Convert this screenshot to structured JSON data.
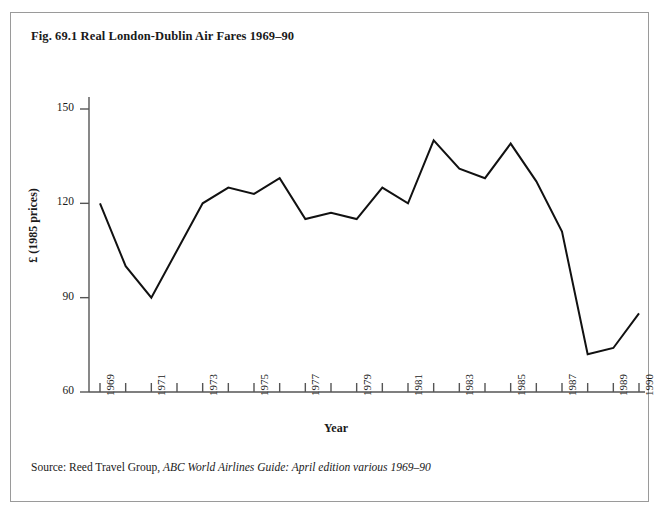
{
  "figure": {
    "title": "Fig. 69.1 Real London-Dublin Air Fares 1969–90",
    "source_prefix": "Source: Reed Travel Group, ",
    "source_italic": "ABC World Airlines Guide: April edition various 1969–90"
  },
  "chart_data": {
    "type": "line",
    "title": "Fig. 69.1 Real London-Dublin Air Fares 1969–90",
    "xlabel": "Year",
    "ylabel": "£ (1985 prices)",
    "x": [
      1969,
      1970,
      1971,
      1972,
      1973,
      1974,
      1975,
      1976,
      1977,
      1978,
      1979,
      1980,
      1981,
      1982,
      1983,
      1984,
      1985,
      1986,
      1987,
      1988,
      1989,
      1990
    ],
    "values": [
      120,
      100,
      90,
      105,
      120,
      125,
      123,
      128,
      115,
      117,
      115,
      125,
      120,
      140,
      131,
      128,
      139,
      127,
      111,
      72,
      74,
      85
    ],
    "series": [
      {
        "name": "Real London-Dublin air fare",
        "values": [
          120,
          100,
          90,
          105,
          120,
          125,
          123,
          128,
          115,
          117,
          115,
          125,
          120,
          140,
          131,
          128,
          139,
          127,
          111,
          72,
          74,
          85
        ]
      }
    ],
    "xlim": [
      1969,
      1990
    ],
    "ylim": [
      60,
      150
    ],
    "yticks": [
      60,
      90,
      120,
      150
    ],
    "ytick_labels": [
      "60",
      "90",
      "120",
      "150"
    ],
    "xticks": [
      1969,
      1970,
      1971,
      1972,
      1973,
      1974,
      1975,
      1976,
      1977,
      1978,
      1979,
      1980,
      1981,
      1982,
      1983,
      1984,
      1985,
      1986,
      1987,
      1988,
      1989,
      1990
    ],
    "xtick_labels_shown": [
      "1969",
      "1971",
      "1973",
      "1975",
      "1977",
      "1979",
      "1981",
      "1983",
      "1985",
      "1987",
      "1989",
      "1990"
    ],
    "xtick_label_rotation": -90,
    "grid": false,
    "legend": false,
    "line_color": "#111111",
    "line_width": 2,
    "axis_color": "#555555",
    "background": "#ffffff"
  }
}
